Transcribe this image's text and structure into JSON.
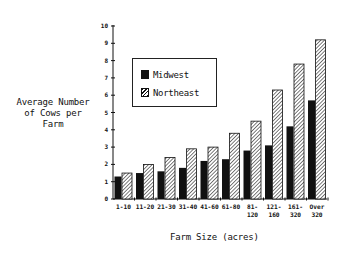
{
  "chart_data": {
    "type": "bar",
    "title": "",
    "xlabel": "Farm Size (acres)",
    "ylabel": "Average Number\nof Cows per\nFarm",
    "ylim": [
      0,
      10
    ],
    "yticks": [
      0,
      1,
      2,
      3,
      4,
      5,
      6,
      7,
      8,
      9,
      10
    ],
    "grid": false,
    "legend_position": "upper-left inside",
    "categories": [
      "1-10",
      "11-20",
      "21-30",
      "31-40",
      "41-60",
      "61-80",
      "81-120",
      "121-160",
      "161-320",
      "Over 320"
    ],
    "category_labels": [
      [
        "1-10"
      ],
      [
        "11-20"
      ],
      [
        "21-30"
      ],
      [
        "31-40"
      ],
      [
        "41-60"
      ],
      [
        "61-80"
      ],
      [
        "81-",
        "120"
      ],
      [
        "121-",
        "160"
      ],
      [
        "161-",
        "320"
      ],
      [
        "Over",
        "320"
      ]
    ],
    "series": [
      {
        "name": "Midwest",
        "pattern": "solid",
        "color": "#111111",
        "values": [
          1.3,
          1.5,
          1.6,
          1.8,
          2.2,
          2.3,
          2.8,
          3.1,
          4.2,
          5.7
        ]
      },
      {
        "name": "Northeast",
        "pattern": "hatched",
        "color": "#111111",
        "values": [
          1.5,
          2.0,
          2.4,
          2.9,
          3.0,
          3.8,
          4.5,
          6.3,
          7.8,
          9.2
        ]
      }
    ]
  },
  "legend": {
    "items": [
      {
        "label": "Midwest"
      },
      {
        "label": "Northeast"
      }
    ]
  }
}
